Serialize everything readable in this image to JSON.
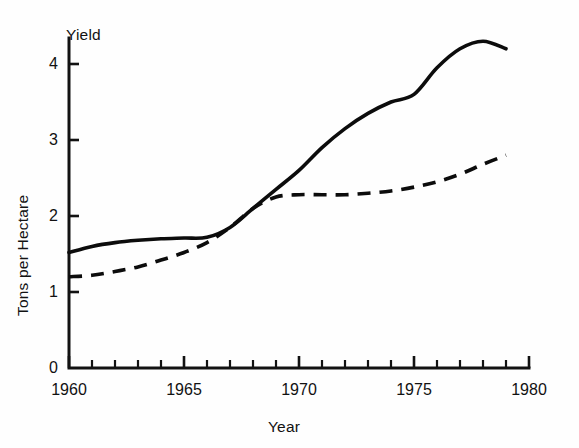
{
  "chart_data": {
    "type": "line",
    "title": "Yield",
    "xlabel": "Year",
    "ylabel": "Tons per Hectare",
    "xlim": [
      1960,
      1980
    ],
    "ylim": [
      0,
      4.5
    ],
    "grid": false,
    "legend": "none",
    "x_tick_labels": [
      "1960",
      "1965",
      "1970",
      "1975",
      "1980"
    ],
    "x_tick_values": [
      1960,
      1965,
      1970,
      1975,
      1980
    ],
    "x_minor_tick_interval": 1,
    "y_tick_labels": [
      "0",
      "1",
      "2",
      "3",
      "4"
    ],
    "y_tick_values": [
      0,
      1,
      2,
      3,
      4
    ],
    "series": [
      {
        "name": "solid-curve",
        "style": "solid",
        "color": "#0c0c0c",
        "x": [
          1960,
          1961,
          1962,
          1963,
          1964,
          1965,
          1966,
          1967,
          1968,
          1969,
          1970,
          1971,
          1972,
          1973,
          1974,
          1975,
          1976,
          1977,
          1978,
          1979
        ],
        "values": [
          1.52,
          1.6,
          1.65,
          1.68,
          1.7,
          1.71,
          1.72,
          1.85,
          2.1,
          2.35,
          2.6,
          2.9,
          3.15,
          3.35,
          3.5,
          3.6,
          3.95,
          4.2,
          4.3,
          4.2
        ]
      },
      {
        "name": "dashed-curve",
        "style": "dashed",
        "color": "#0c0c0c",
        "x": [
          1960,
          1961,
          1962,
          1963,
          1964,
          1965,
          1966,
          1967,
          1968,
          1969,
          1970,
          1971,
          1972,
          1973,
          1974,
          1975,
          1976,
          1977,
          1978,
          1979
        ],
        "values": [
          1.2,
          1.22,
          1.27,
          1.33,
          1.42,
          1.52,
          1.65,
          1.85,
          2.1,
          2.25,
          2.28,
          2.28,
          2.28,
          2.3,
          2.33,
          2.38,
          2.45,
          2.55,
          2.68,
          2.8
        ]
      }
    ],
    "annotations": []
  },
  "axes": {
    "y_title": "Tons per Hectare",
    "top_label": "Yield",
    "x_title": "Year"
  }
}
